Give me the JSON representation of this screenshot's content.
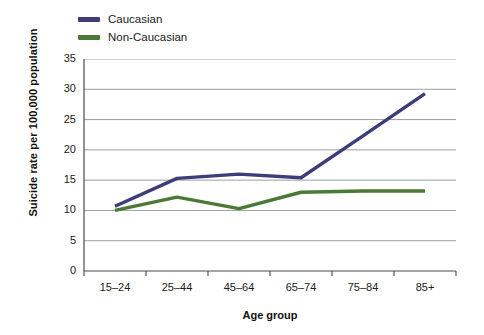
{
  "chart_data": {
    "type": "line",
    "title": "",
    "xlabel": "Age group",
    "ylabel": "Suicide rate per 100,000 population",
    "categories": [
      "15–24",
      "25–44",
      "45–64",
      "65–74",
      "75–84",
      "85+"
    ],
    "yticks": [
      0,
      5,
      10,
      15,
      20,
      25,
      30,
      35
    ],
    "ylim": [
      0,
      35
    ],
    "grid": true,
    "legend_position": "top-left",
    "series": [
      {
        "name": "Caucasian",
        "color": "#3d3d7a",
        "values": [
          10.7,
          15.3,
          16.0,
          15.4,
          22.3,
          29.3
        ]
      },
      {
        "name": "Non-Caucasian",
        "color": "#4a7a35",
        "values": [
          10.0,
          12.2,
          10.3,
          13.0,
          13.2,
          13.2
        ]
      }
    ]
  },
  "style": {
    "grid_color": "#8f9499",
    "axis_color": "#4a4a4a",
    "background": "#ffffff",
    "text_color": "#1a1a1a"
  }
}
